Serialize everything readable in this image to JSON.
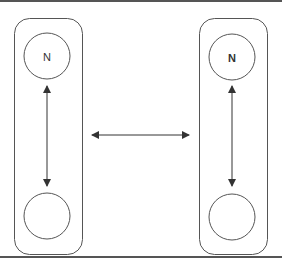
{
  "diagram": {
    "panels": [
      {
        "id": "left",
        "top_node": {
          "label": "N",
          "bold": false
        },
        "bottom_node": {
          "label": "",
          "bold": false
        },
        "connector": "bidirectional"
      },
      {
        "id": "right",
        "top_node": {
          "label": "N",
          "bold": true
        },
        "bottom_node": {
          "label": "",
          "bold": false
        },
        "connector": "bidirectional"
      }
    ],
    "link_between_panels": "bidirectional",
    "colors": {
      "stroke": "#555555",
      "arrow": "#333333",
      "background": "#ffffff"
    }
  }
}
